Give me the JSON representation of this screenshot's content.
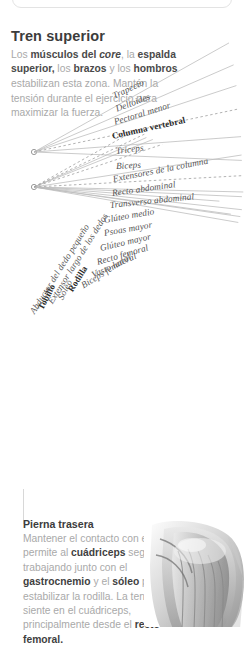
{
  "header": {
    "title": "Tren superior",
    "body_segments": [
      {
        "t": "Los ",
        "style": "normal"
      },
      {
        "t": "músculos del ",
        "style": "bold"
      },
      {
        "t": "core",
        "style": "bold-italic"
      },
      {
        "t": ", la ",
        "style": "normal"
      },
      {
        "t": "espalda superior,",
        "style": "bold"
      },
      {
        "t": " los ",
        "style": "normal"
      },
      {
        "t": "brazos",
        "style": "bold"
      },
      {
        "t": " y los ",
        "style": "normal"
      },
      {
        "t": "hombros",
        "style": "bold"
      },
      {
        "t": " estabilizan esta zona. Mantén la tensión durante el ejercicio para maximizar la fuerza.",
        "style": "normal"
      }
    ],
    "body_plain": "Los músculos del core, la espalda superior, los brazos y los hombros estabilizan esta zona. Mantén la tensión durante el ejercicio para maximizar la fuerza."
  },
  "diagram": {
    "hubs": [
      {
        "id": "upper-hub",
        "x": 34,
        "y": 152
      },
      {
        "id": "lower-hub",
        "x": 34,
        "y": 187
      }
    ],
    "labels": [
      {
        "text": "Trapecio",
        "hub": 0,
        "bold": false,
        "dashed": false,
        "angle": -25.0,
        "lx": 113,
        "ly": 97,
        "len": 128
      },
      {
        "text": "Deltoides",
        "hub": 0,
        "bold": false,
        "dashed": false,
        "angle": -21.0,
        "lx": 116,
        "ly": 110,
        "len": 126
      },
      {
        "text": "Pectoral menor",
        "hub": 0,
        "bold": false,
        "dashed": false,
        "angle": -17.0,
        "lx": 114,
        "ly": 123,
        "len": 128
      },
      {
        "text": "Columna vertebral",
        "hub": 0,
        "bold": true,
        "dashed": true,
        "angle": -12.5,
        "lx": 112,
        "ly": 137,
        "len": 130
      },
      {
        "text": "Triceps",
        "hub": 0,
        "bold": false,
        "dashed": false,
        "angle": -7.0,
        "lx": 116,
        "ly": 152,
        "len": 126
      },
      {
        "text": "Biceps",
        "hub": 0,
        "bold": false,
        "dashed": false,
        "angle": -3.0,
        "lx": 116,
        "ly": 167,
        "len": 126
      },
      {
        "text": "Extensores de la columna",
        "hub": 1,
        "bold": false,
        "dashed": false,
        "angle": -11.0,
        "lx": 113,
        "ly": 180,
        "len": 131
      },
      {
        "text": "Recto abdominal",
        "hub": 1,
        "bold": false,
        "dashed": true,
        "angle": -8.0,
        "lx": 112,
        "ly": 194,
        "len": 132
      },
      {
        "text": "Transverso abdominal",
        "hub": 1,
        "bold": false,
        "dashed": false,
        "angle": -6.0,
        "lx": 110,
        "ly": 206,
        "len": 134
      },
      {
        "text": "Glúteo medio",
        "hub": 1,
        "bold": false,
        "dashed": false,
        "angle": -10.0,
        "lx": 104,
        "ly": 221,
        "len": 140
      },
      {
        "text": "Psoas mayor",
        "hub": 1,
        "bold": false,
        "dashed": false,
        "angle": -10.0,
        "lx": 104,
        "ly": 234,
        "len": 140
      },
      {
        "text": "Glúteo mayor",
        "hub": 1,
        "bold": false,
        "dashed": false,
        "angle": -13.0,
        "lx": 100,
        "ly": 249,
        "len": 144
      },
      {
        "text": "Recto femoral",
        "hub": 1,
        "bold": false,
        "dashed": false,
        "angle": -16.0,
        "lx": 97,
        "ly": 263,
        "len": 147
      },
      {
        "text": "Vasto lateral",
        "hub": 1,
        "bold": false,
        "dashed": false,
        "angle": -24.0,
        "lx": 92,
        "ly": 276,
        "len": 152
      },
      {
        "text": "Biceps femoral",
        "hub": 1,
        "bold": false,
        "dashed": false,
        "angle": -32.0,
        "lx": 82,
        "ly": 287,
        "len": 162
      },
      {
        "text": "Rodilla",
        "hub": 1,
        "bold": true,
        "dashed": true,
        "angle": -58.0,
        "lx": 70,
        "ly": 292,
        "len": 174
      },
      {
        "text": "Sóleo",
        "hub": 1,
        "bold": false,
        "dashed": false,
        "angle": -62.0,
        "lx": 60,
        "ly": 300,
        "len": 184
      },
      {
        "text": "Extensor largo de los dedos",
        "hub": 1,
        "bold": false,
        "dashed": false,
        "angle": -58.0,
        "lx": 50,
        "ly": 304,
        "len": 194
      },
      {
        "text": "Tobillo",
        "hub": 1,
        "bold": true,
        "dashed": true,
        "angle": -62.0,
        "lx": 40,
        "ly": 310,
        "len": 204
      },
      {
        "text": "Abductor del dedo pequeño",
        "hub": 1,
        "bold": false,
        "dashed": true,
        "angle": -58.0,
        "lx": 32,
        "ly": 314,
        "len": 212
      }
    ]
  },
  "footer": {
    "title": "Pierna trasera",
    "body_plain": "Mantener el contacto con el suelo permite al cuádriceps seguir trabajando junto con el gastrocnemio y el sóleo para estabilizar la rodilla. La tensión se siente en el cuádriceps, principalmente desde el recto femoral.",
    "body_segments": [
      {
        "t": "Mantener el contacto con el suelo permite al ",
        "style": "normal"
      },
      {
        "t": "cuádriceps",
        "style": "bold"
      },
      {
        "t": " seguir trabajando junto con el ",
        "style": "normal"
      },
      {
        "t": "gastrocnemio",
        "style": "bold"
      },
      {
        "t": " y el ",
        "style": "normal"
      },
      {
        "t": "sóleo",
        "style": "bold"
      },
      {
        "t": " para estabilizar la rodilla. La tensión se siente en el cuádriceps, principalmente desde el ",
        "style": "normal"
      },
      {
        "t": "recto femoral.",
        "style": "bold"
      }
    ]
  },
  "art": {
    "name": "knee-anatomy-illustration"
  },
  "colors": {
    "heading": "#3c3c3c",
    "body_muted": "#a9a9a9",
    "body_strong": "#4a4a4a",
    "label": "#545454",
    "label_bold": "#2c2c2c",
    "line": "#b9b9b9",
    "card_border": "#e3e3e3",
    "background": "#ffffff"
  }
}
